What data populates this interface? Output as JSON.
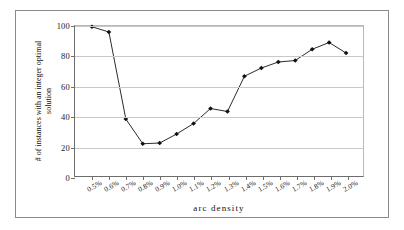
{
  "chart_data": {
    "type": "line",
    "title": "",
    "xlabel": "arc density",
    "ylabel_lines": [
      "# of instances with an integer optimal",
      "solution"
    ],
    "ylabel": "# of instances with an integer optimal solution",
    "categories": [
      "0.5%",
      "0.6%",
      "0.7%",
      "0.8%",
      "0.9%",
      "1.0%",
      "1.1%",
      "1.2%",
      "1.3%",
      "1.4%",
      "1.5%",
      "1.6%",
      "1.7%",
      "1.8%",
      "1.9%",
      "2.0%"
    ],
    "values": [
      99.5,
      96,
      38,
      21.5,
      22,
      28,
      35,
      45,
      43,
      66.5,
      72,
      76,
      77,
      84.5,
      89,
      82
    ],
    "ylim": [
      0,
      100
    ],
    "yticks": [
      0,
      20,
      40,
      60,
      80,
      100
    ],
    "grid": true,
    "legend": "none",
    "marker": "diamond",
    "line_color": "#111111",
    "marker_color": "#111111",
    "grid_color": "#c8c8c8"
  }
}
